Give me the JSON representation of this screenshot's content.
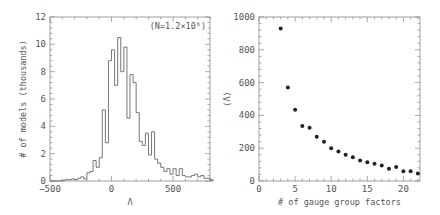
{
  "chart_data": [
    {
      "type": "bar",
      "style": "step-histogram",
      "title": "",
      "xlabel": "Λ",
      "ylabel": "# of models (thousands)",
      "xlim": [
        -500,
        800
      ],
      "ylim": [
        0,
        12
      ],
      "xticks": [
        -500,
        0,
        500
      ],
      "yticks": [
        0,
        2,
        4,
        6,
        8,
        10,
        12
      ],
      "annotation": "(N=1.2×10⁶)",
      "bin_width": 25,
      "bin_edges_start": -400,
      "values": [
        0.05,
        0.1,
        0.1,
        0.15,
        0.1,
        0.2,
        0.3,
        0.15,
        0.6,
        0.7,
        1.5,
        1.0,
        1.7,
        5.2,
        2.8,
        8.8,
        9.6,
        7.0,
        10.5,
        8.0,
        9.8,
        4.6,
        7.8,
        7.2,
        5.0,
        2.9,
        2.6,
        3.5,
        1.9,
        3.6,
        1.6,
        1.3,
        1.0,
        0.7,
        0.9,
        0.5,
        0.9,
        0.4,
        0.9,
        0.4,
        0.3,
        0.3,
        0.4,
        0.5,
        0.3,
        0.4,
        0.2,
        0.2,
        0.1
      ]
    },
    {
      "type": "scatter",
      "title": "",
      "xlabel": "# of gauge group factors",
      "ylabel": "⟨Λ⟩",
      "xlim": [
        0,
        22.3
      ],
      "ylim": [
        0,
        1000
      ],
      "xticks": [
        0,
        5,
        10,
        15,
        20
      ],
      "yticks": [
        0,
        200,
        400,
        600,
        800,
        1000
      ],
      "x": [
        3,
        4,
        5,
        6,
        7,
        8,
        9,
        10,
        11,
        12,
        13,
        14,
        15,
        16,
        17,
        18,
        19,
        20,
        21,
        22
      ],
      "y": [
        930,
        570,
        435,
        335,
        325,
        270,
        240,
        200,
        180,
        160,
        145,
        125,
        115,
        105,
        95,
        75,
        85,
        60,
        60,
        45
      ]
    }
  ]
}
